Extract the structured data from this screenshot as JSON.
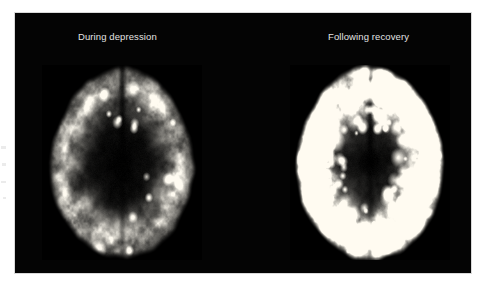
{
  "figure": {
    "type": "medical-brain-scan-comparison",
    "modality": "functional brain scan (axial slice)",
    "background_color": "#ffffff",
    "panel_color": "#040404",
    "label_color": "#e3e3e3"
  },
  "panels": [
    {
      "id": "during-depression",
      "label": "During depression",
      "description": "Axial brain slice showing markedly reduced uptake; mostly dark with sparse small bright foci",
      "brightness": 0.34,
      "hotspot_count": 16,
      "bright_patch_count": 4,
      "seed": 20461,
      "cx": 0.5,
      "cy": 0.5,
      "rx": 0.455,
      "ry": 0.49
    },
    {
      "id": "following-recovery",
      "label": "Following recovery",
      "description": "Axial brain slice showing widespread increased uptake; large bright cortical ribbons and many bright foci",
      "brightness": 0.92,
      "hotspot_count": 120,
      "bright_patch_count": 26,
      "seed": 77113,
      "cx": 0.5,
      "cy": 0.5,
      "rx": 0.465,
      "ry": 0.5
    }
  ],
  "margin_artifacts": [
    {
      "x": 1,
      "y": 146,
      "w": 5,
      "h": 3
    },
    {
      "x": 2,
      "y": 163,
      "w": 4,
      "h": 3
    },
    {
      "x": 1,
      "y": 181,
      "w": 5,
      "h": 2
    },
    {
      "x": 3,
      "y": 197,
      "w": 3,
      "h": 2
    }
  ]
}
